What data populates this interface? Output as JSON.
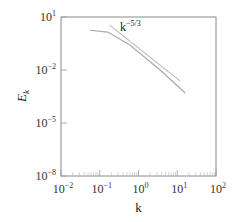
{
  "chart_data": {
    "type": "line",
    "title": "",
    "xlabel": "k",
    "ylabel": "E_k",
    "xscale": "log",
    "yscale": "log",
    "xlim": [
      0.01,
      100
    ],
    "ylim": [
      1e-08,
      10
    ],
    "grid": false,
    "legend": null,
    "x_ticks": [
      {
        "base": "10",
        "exp": "−2"
      },
      {
        "base": "10",
        "exp": "−1"
      },
      {
        "base": "10",
        "exp": "0"
      },
      {
        "base": "10",
        "exp": "1"
      },
      {
        "base": "10",
        "exp": "2"
      }
    ],
    "y_ticks": [
      {
        "base": "10",
        "exp": "1"
      },
      {
        "base": "10",
        "exp": "−2"
      },
      {
        "base": "10",
        "exp": "−5"
      },
      {
        "base": "10",
        "exp": "−8"
      }
    ],
    "series": [
      {
        "name": "E_k spectrum",
        "color": "#a8a8a8",
        "x": [
          0.056,
          0.16,
          0.6,
          3.6,
          16
        ],
        "y": [
          1.8,
          1.4,
          0.26,
          0.01,
          0.0005
        ]
      },
      {
        "name": "k^-5/3 reference",
        "color": "#b8b8b8",
        "x": [
          0.18,
          11.7
        ],
        "y": [
          3.5,
          0.0024
        ]
      }
    ],
    "annotations": [
      {
        "text_base": "k",
        "text_exp": "−5/3",
        "x": 0.3,
        "y": 4
      }
    ]
  }
}
